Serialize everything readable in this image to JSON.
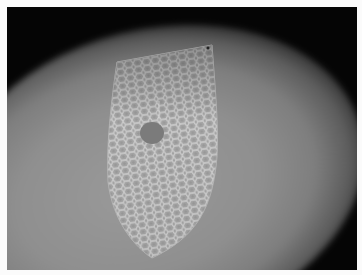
{
  "image": {
    "description": "Grayscale photograph of a shield-shaped perforated mesh with a circular hole, lit by a soft spotlight against a dark background",
    "colors": {
      "background_dark": "#050505",
      "spotlight": "#959595",
      "mesh": "#c8c8c8",
      "hole": "#7d7d7d",
      "border": "#fbfbfb"
    }
  }
}
